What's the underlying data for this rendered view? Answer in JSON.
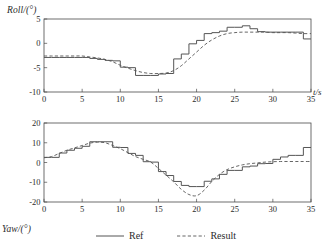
{
  "figure": {
    "background": "#ffffff",
    "line_color": "#555555",
    "axis_color": "#4a4a4a"
  },
  "legend": {
    "position": "bottom-center",
    "entries": [
      {
        "label": "Ref",
        "style": "solid",
        "icon": "solid-line-icon"
      },
      {
        "label": "Result",
        "style": "dashed",
        "icon": "dashed-line-icon"
      }
    ]
  },
  "chart_data": [
    {
      "id": "roll",
      "type": "line",
      "title": "",
      "ylabel": "Roll/(°)",
      "xlabel": "t/s",
      "xlim": [
        0,
        35
      ],
      "ylim": [
        -10,
        5
      ],
      "xticks": [
        0,
        5,
        10,
        15,
        20,
        25,
        30,
        35
      ],
      "xticklabels": [
        "0",
        "5",
        "10",
        "15",
        "20",
        "25",
        "30",
        "35"
      ],
      "yticks": [
        5,
        0,
        -5,
        -10
      ],
      "yticklabels": [
        "5",
        "0",
        "-5",
        "-10"
      ],
      "grid": false,
      "series": [
        {
          "name": "Ref",
          "style": "solid",
          "drawstyle": "steps-post",
          "x": [
            0,
            1,
            2,
            3,
            4,
            5,
            6,
            7,
            8,
            9,
            10,
            11,
            12,
            13,
            14,
            15,
            16,
            17,
            18,
            19,
            20,
            21,
            22,
            23,
            24,
            25,
            26,
            27,
            28,
            29,
            30,
            31,
            32,
            33,
            34,
            35
          ],
          "values": [
            -2.9,
            -2.9,
            -2.9,
            -2.9,
            -2.9,
            -2.9,
            -3.1,
            -3.3,
            -3.5,
            -3.6,
            -4.9,
            -5.0,
            -6.6,
            -6.6,
            -6.6,
            -6.3,
            -6.2,
            -3.2,
            -2.2,
            -0.1,
            0.6,
            2.0,
            2.2,
            2.5,
            3.3,
            3.3,
            3.6,
            3.0,
            2.4,
            2.3,
            2.3,
            2.3,
            2.3,
            2.3,
            0.9,
            0.9
          ]
        },
        {
          "name": "Result",
          "style": "dashed",
          "drawstyle": "smooth",
          "x": [
            0,
            1,
            2,
            3,
            4,
            5,
            6,
            7,
            8,
            9,
            10,
            11,
            12,
            13,
            14,
            15,
            16,
            17,
            18,
            19,
            20,
            21,
            22,
            23,
            24,
            25,
            26,
            27,
            28,
            29,
            30,
            31,
            32,
            33,
            34,
            35
          ],
          "values": [
            -2.6,
            -2.6,
            -2.6,
            -2.6,
            -2.6,
            -2.6,
            -2.8,
            -3.0,
            -3.3,
            -3.8,
            -4.5,
            -5.1,
            -5.6,
            -6.0,
            -6.2,
            -6.2,
            -6.1,
            -5.6,
            -4.6,
            -3.2,
            -1.8,
            -0.4,
            0.7,
            1.5,
            2.0,
            2.2,
            2.3,
            2.3,
            2.3,
            2.3,
            2.2,
            2.2,
            2.2,
            2.1,
            2.0,
            2.0
          ]
        }
      ]
    },
    {
      "id": "yaw",
      "type": "line",
      "title": "",
      "ylabel": "Yaw/(°)",
      "xlabel": "t/s",
      "xlim": [
        0,
        35
      ],
      "ylim": [
        -20,
        20
      ],
      "xticks": [
        0,
        5,
        10,
        15,
        20,
        25,
        30,
        35
      ],
      "xticklabels": [
        "0",
        "5",
        "10",
        "15",
        "20",
        "25",
        "30",
        "35"
      ],
      "yticks": [
        20,
        10,
        0,
        -10,
        -20
      ],
      "yticklabels": [
        "20",
        "10",
        "0",
        "-10",
        "-20"
      ],
      "grid": false,
      "series": [
        {
          "name": "Ref",
          "style": "solid",
          "drawstyle": "steps-post",
          "x": [
            0,
            1,
            2,
            3,
            4,
            5,
            6,
            7,
            8,
            9,
            10,
            11,
            12,
            13,
            14,
            15,
            16,
            17,
            18,
            19,
            20,
            21,
            22,
            23,
            24,
            25,
            26,
            27,
            28,
            29,
            30,
            31,
            32,
            33,
            34,
            35
          ],
          "values": [
            2.6,
            2.6,
            4.8,
            6.2,
            7.2,
            8.2,
            10.5,
            10.5,
            10.5,
            7.7,
            7.6,
            4.6,
            3.6,
            0.4,
            0.2,
            -4.6,
            -6.6,
            -9.6,
            -11.6,
            -12.2,
            -12.2,
            -9.5,
            -8.3,
            -6.0,
            -4.0,
            -4.0,
            -2.2,
            -1.8,
            -0.6,
            -0.5,
            1.6,
            2.8,
            3.6,
            3.6,
            7.6,
            7.6
          ]
        },
        {
          "name": "Result",
          "style": "dashed",
          "drawstyle": "smooth",
          "x": [
            0,
            1,
            2,
            3,
            4,
            5,
            6,
            7,
            8,
            9,
            10,
            11,
            12,
            13,
            14,
            15,
            16,
            17,
            18,
            19,
            20,
            21,
            22,
            23,
            24,
            25,
            26,
            27,
            28,
            29,
            30,
            31,
            32,
            33,
            34,
            35
          ],
          "values": [
            2.4,
            3.0,
            4.6,
            6.2,
            7.4,
            8.6,
            9.8,
            10.3,
            10.0,
            8.6,
            7.0,
            5.0,
            3.0,
            1.6,
            0.2,
            -3.0,
            -6.4,
            -9.8,
            -13.6,
            -16.2,
            -16.8,
            -14.0,
            -9.6,
            -6.0,
            -3.6,
            -2.2,
            -1.2,
            -0.6,
            -0.2,
            0.2,
            0.4,
            0.5,
            0.5,
            0.5,
            0.5,
            0.5
          ]
        }
      ]
    }
  ]
}
